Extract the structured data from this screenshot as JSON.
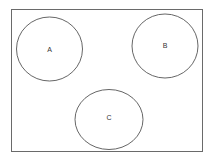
{
  "diagram": {
    "frame": {
      "stroke": "#6a6a6a"
    },
    "circles": [
      {
        "label": "A",
        "cx": 49.5,
        "cy": 49,
        "rx": 33,
        "ry": 32
      },
      {
        "label": "B",
        "cx": 165,
        "cy": 46,
        "rx": 33,
        "ry": 32
      },
      {
        "label": "C",
        "cx": 109,
        "cy": 119.5,
        "rx": 34,
        "ry": 30
      }
    ],
    "stroke_color": "#555555"
  }
}
